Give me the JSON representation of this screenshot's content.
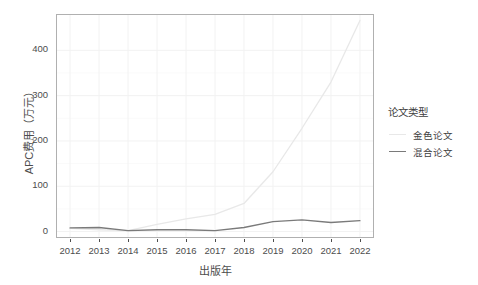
{
  "chart_data": {
    "type": "line",
    "title": "",
    "subtitle": "",
    "xlabel": "出版年",
    "ylabel": "APC费用（万元）",
    "x": [
      2012,
      2013,
      2014,
      2015,
      2016,
      2017,
      2018,
      2019,
      2020,
      2021,
      2022
    ],
    "xtick_labels": [
      "2012",
      "2013",
      "2014",
      "2015",
      "2016",
      "2017",
      "2018",
      "2019",
      "2020",
      "2021",
      "2022"
    ],
    "ytick_labels": [
      "0",
      "100",
      "200",
      "300",
      "400"
    ],
    "ytick_values": [
      0,
      100,
      200,
      300,
      400
    ],
    "xlim": [
      2011.55,
      2022.45
    ],
    "ylim": [
      -12,
      478
    ],
    "grid": true,
    "legend_position": "right",
    "legend_title": "论文类型",
    "series": [
      {
        "name": "金色论文",
        "color": "#e8e8e8",
        "values": [
          7,
          4,
          2,
          16,
          28,
          38,
          62,
          132,
          228,
          330,
          466
        ]
      },
      {
        "name": "混合论文",
        "color": "#7a7a7a",
        "values": [
          8,
          9,
          2,
          4,
          4,
          2,
          9,
          22,
          26,
          20,
          24
        ]
      }
    ]
  },
  "legend": {
    "title": "论文类型",
    "items": [
      {
        "label": "金色论文",
        "color": "#e8e8e8"
      },
      {
        "label": "混合论文",
        "color": "#7a7a7a"
      }
    ]
  },
  "axes": {
    "x_title": "出版年",
    "y_title": "APC费用（万元）",
    "x_ticks": [
      "2012",
      "2013",
      "2014",
      "2015",
      "2016",
      "2017",
      "2018",
      "2019",
      "2020",
      "2021",
      "2022"
    ],
    "y_ticks": [
      "0",
      "100",
      "200",
      "300",
      "400"
    ]
  },
  "theme": {
    "panel_background": "#ffffff",
    "panel_border": "#b0b0b0",
    "grid_color": "#f2f2f2",
    "text_color": "#4d4d4d"
  }
}
